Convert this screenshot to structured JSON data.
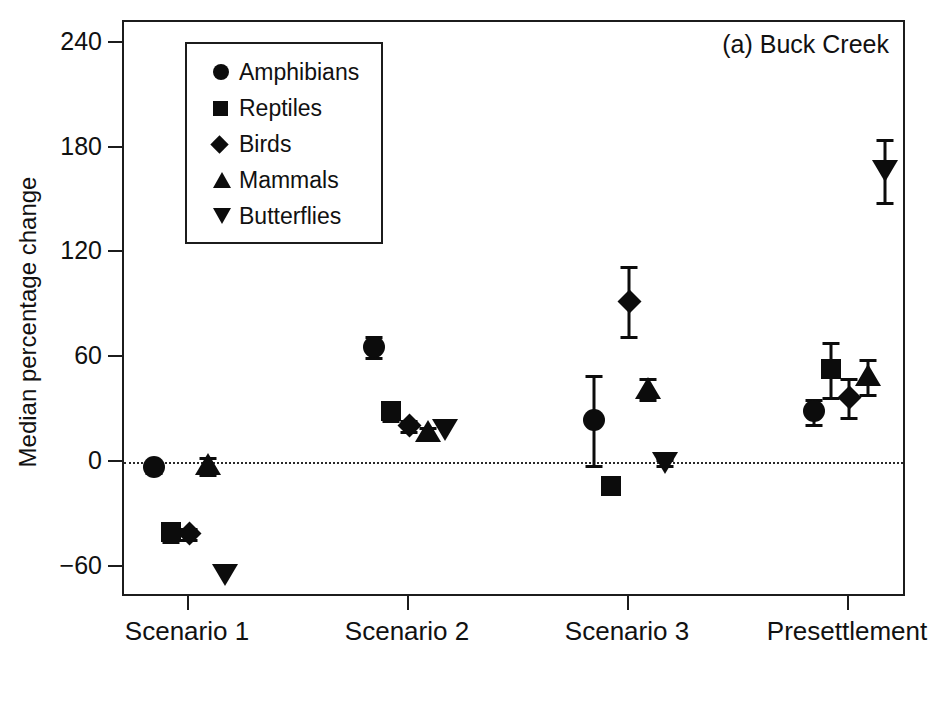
{
  "panel": {
    "label": "(a) Buck Creek"
  },
  "axes": {
    "y_title": "Median percentage change",
    "y_ticks": [
      240,
      180,
      120,
      60,
      0,
      -60
    ],
    "y_tick_labels": [
      "240",
      "180",
      "120",
      "60",
      "0",
      "−60"
    ],
    "x_tick_labels": [
      "Scenario 1",
      "Scenario 2",
      "Scenario 3",
      "Presettlement"
    ]
  },
  "legend": {
    "items": [
      {
        "label": "Amphibians",
        "marker": "circle",
        "marker_icon": "filled-circle-icon"
      },
      {
        "label": "Reptiles",
        "marker": "square",
        "marker_icon": "filled-square-icon"
      },
      {
        "label": "Birds",
        "marker": "diamond",
        "marker_icon": "filled-diamond-icon"
      },
      {
        "label": "Mammals",
        "marker": "triangle-up",
        "marker_icon": "filled-triangle-up-icon"
      },
      {
        "label": "Butterflies",
        "marker": "triangle-down",
        "marker_icon": "filled-triangle-down-icon"
      }
    ]
  },
  "colors": {
    "marker": "#0c0c0c",
    "axis": "#1c1c1c",
    "background": "#ffffff",
    "zero_line": "#2a2a2a"
  },
  "chart_data": {
    "type": "scatter",
    "title": "(a) Buck Creek",
    "xlabel": "",
    "ylabel": "Median percentage change",
    "ylim": [
      -80,
      258
    ],
    "yticks": [
      -60,
      0,
      60,
      120,
      180,
      240
    ],
    "grid": false,
    "zero_reference_line": 0,
    "legend_position": "upper-left-inset",
    "categories": [
      "Scenario 1",
      "Scenario 2",
      "Scenario 3",
      "Presettlement"
    ],
    "error_bar_type": "interquartile-range",
    "series": [
      {
        "name": "Amphibians",
        "marker": "circle",
        "values": [
          -3,
          66,
          24,
          29
        ],
        "err_low": [
          3,
          6,
          26,
          7
        ],
        "err_high": [
          3,
          6,
          26,
          7
        ]
      },
      {
        "name": "Reptiles",
        "marker": "square",
        "values": [
          -40,
          29,
          -14,
          53
        ],
        "err_low": [
          5,
          5,
          4,
          16
        ],
        "err_high": [
          5,
          5,
          4,
          16
        ]
      },
      {
        "name": "Birds",
        "marker": "diamond",
        "values": [
          -41,
          21,
          92,
          37
        ],
        "err_low": [
          3,
          3,
          20,
          11
        ],
        "err_high": [
          3,
          3,
          20,
          11
        ]
      },
      {
        "name": "Mammals",
        "marker": "triangle-up",
        "values": [
          -2,
          17,
          42,
          49
        ],
        "err_low": [
          5,
          3,
          6,
          10
        ],
        "err_high": [
          5,
          3,
          6,
          10
        ]
      },
      {
        "name": "Butterflies",
        "marker": "triangle-down",
        "values": [
          -64,
          19,
          0,
          167
        ],
        "err_low": [
          0,
          0,
          2,
          18
        ],
        "err_high": [
          0,
          0,
          2,
          18
        ]
      }
    ]
  }
}
